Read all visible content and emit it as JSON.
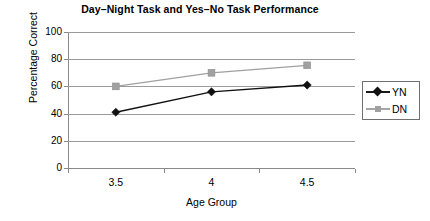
{
  "chart_data": {
    "type": "line",
    "title": "Day–Night Task and Yes–No Task Performance",
    "xlabel": "Age Group",
    "ylabel": "Percentage Correct",
    "categories": [
      "3.5",
      "4",
      "4.5"
    ],
    "x": [
      3.5,
      4,
      4.5
    ],
    "series": [
      {
        "name": "YN",
        "values": [
          41,
          56,
          61
        ],
        "color": "#111111",
        "marker": "diamond"
      },
      {
        "name": "DN",
        "values": [
          60,
          70,
          75.5
        ],
        "color": "#a0a0a0",
        "marker": "square"
      }
    ],
    "ylim": [
      0,
      100
    ],
    "ytick_labels": [
      "100",
      "80",
      "60",
      "40",
      "20",
      "0"
    ],
    "ytick_values": [
      100,
      80,
      60,
      40,
      20,
      0
    ],
    "xtick_labels": [
      "3.5",
      "4",
      "4.5"
    ],
    "grid": "horizontal",
    "legend_position": "right"
  },
  "legend": {
    "items": [
      {
        "label": "YN"
      },
      {
        "label": "DN"
      }
    ]
  },
  "axes": {
    "y_title": "Percentage Correct",
    "x_title": "Age Group"
  },
  "colors": {
    "yn_series": "#111111",
    "dn_series": "#a0a0a0",
    "gridline": "#9a9a9a",
    "axis": "#8a8a8a",
    "background": "#ffffff",
    "text": "#000000"
  }
}
